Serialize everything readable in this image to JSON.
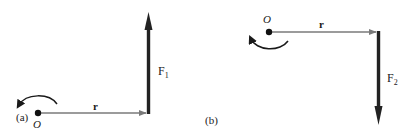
{
  "colors": {
    "background": "#ffffff",
    "ink": "#1a1a1a",
    "r_vector": "#7a7a7a",
    "force_vector": "#222222"
  },
  "panels": [
    {
      "id": "a",
      "label": "(a)",
      "origin_label": "O",
      "position_vector_label": "r",
      "force_label": "F",
      "force_subscript": "1",
      "force_direction": "up",
      "torque_rotation": "counterclockwise"
    },
    {
      "id": "b",
      "label": "(b)",
      "origin_label": "O",
      "position_vector_label": "r",
      "force_label": "F",
      "force_subscript": "2",
      "force_direction": "down",
      "torque_rotation": "clockwise"
    }
  ]
}
